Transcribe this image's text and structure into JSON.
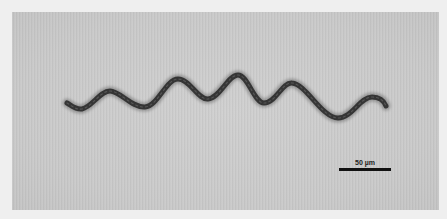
{
  "image": {
    "subject": "spiral-shaped bacterium (spirochete) micrograph",
    "background_color": "#cacaca",
    "border_color": "#efefef",
    "specimen_color": "#3a3a3a"
  },
  "scale_bar": {
    "label": "50 µm",
    "color": "#111111"
  }
}
